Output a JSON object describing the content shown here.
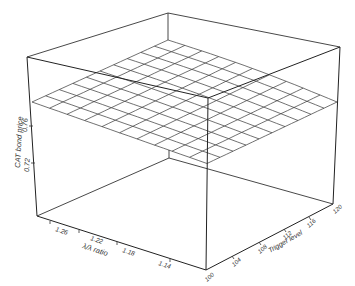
{
  "chart_data": {
    "type": "surface3d",
    "title": "",
    "zlabel": "CAT bond price",
    "xlabel": "λ/λ ratio",
    "ylabel": "Trigger level",
    "z_ticks": [
      "0.72",
      "0.76"
    ],
    "x_ticks": [
      "1.26",
      "1.22",
      "1.18",
      "1.14"
    ],
    "y_ticks": [
      "100",
      "104",
      "108",
      "112",
      "116",
      "120"
    ],
    "x_range": [
      1.12,
      1.28
    ],
    "y_range": [
      100,
      120
    ],
    "zlim": [
      0.7,
      0.8
    ],
    "grid_cells": [
      10,
      10
    ],
    "surface_description": "Nearly flat wireframe surface around CAT bond price ≈ 0.77-0.78, rising slightly toward low λ/λ ratio and high trigger level",
    "surface_z_approx": {
      "corner_high_ratio_low_trigger": 0.77,
      "corner_high_ratio_high_trigger": 0.783,
      "corner_low_ratio_low_trigger": 0.772,
      "corner_low_ratio_high_trigger": 0.778
    },
    "line_color": "#333333"
  }
}
